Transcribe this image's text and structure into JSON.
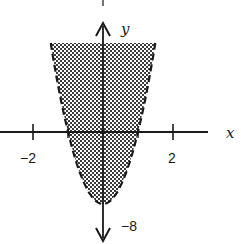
{
  "chart_data": {
    "type": "area",
    "title": "",
    "inequality": "y > 8x^2 - 8",
    "boundary": {
      "equation": "y = 8x^2 - 8",
      "style": "dashed",
      "vertex": [
        0,
        -8
      ],
      "x_intercepts": [
        -1,
        1
      ]
    },
    "shaded_region": "inside parabola (above boundary)",
    "xlabel": "x",
    "ylabel": "y",
    "x_ticks": [
      -2,
      -1,
      1,
      2
    ],
    "x_tick_labels": [
      "-2",
      "2"
    ],
    "y_tick_labels": [
      "-8"
    ],
    "xlim": [
      -2.9,
      3.0
    ],
    "ylim": [
      -12,
      14
    ],
    "grid": false,
    "legend": null
  },
  "labels": {
    "x_axis": "x",
    "y_axis": "y",
    "x_neg2": "−2",
    "x_pos2": "2",
    "y_neg8": "−8"
  },
  "colors": {
    "ink": "#1a1a1a",
    "shade": "#8a8a8a",
    "background": "#ffffff"
  }
}
